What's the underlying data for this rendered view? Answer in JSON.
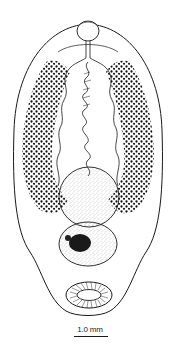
{
  "figure": {
    "structures": [
      "oral-sucker",
      "pharynx",
      "intestinal-ceca",
      "vitellaria",
      "uterus",
      "anterior-testis",
      "posterior-testis",
      "ovary",
      "ventral-sucker"
    ],
    "ink_color": "#1a1a1a",
    "background": "#ffffff"
  },
  "scale_bar": {
    "label": "1.0 mm"
  }
}
